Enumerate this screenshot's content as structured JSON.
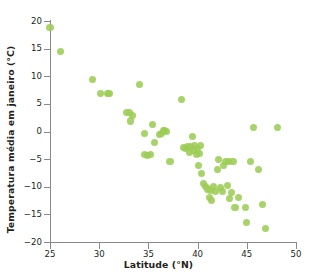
{
  "chart_data": {
    "type": "scatter",
    "title": "",
    "xlabel": "Latitude (°N)",
    "ylabel": "Temperatura média em janeiro (°C)",
    "xlim": [
      25,
      50
    ],
    "ylim": [
      -20,
      20
    ],
    "xticks": [
      25,
      30,
      35,
      40,
      45,
      50
    ],
    "yticks": [
      20,
      15,
      10,
      5,
      0,
      -5,
      -10,
      -15,
      -20
    ],
    "xtick_labels": [
      "25",
      "30",
      "35",
      "40",
      "45",
      "50"
    ],
    "ytick_labels": [
      "20",
      "15",
      "10",
      "5",
      "0",
      "−5",
      "−10",
      "−15",
      "−20"
    ],
    "grid": false,
    "legend": null,
    "marker_color": "#9ccc55",
    "axis_color": "#8a8a8a",
    "text_color": "#231f20",
    "series": [
      {
        "name": "Cidades",
        "points": [
          [
            25.0,
            18.9
          ],
          [
            26.1,
            14.5
          ],
          [
            29.3,
            9.4
          ],
          [
            30.1,
            6.9
          ],
          [
            30.8,
            6.9
          ],
          [
            31.0,
            6.8
          ],
          [
            32.8,
            3.4
          ],
          [
            33.1,
            3.4
          ],
          [
            33.4,
            2.9
          ],
          [
            33.2,
            1.9
          ],
          [
            34.1,
            8.5
          ],
          [
            34.6,
            -0.4
          ],
          [
            34.6,
            -4.2
          ],
          [
            34.9,
            -4.3
          ],
          [
            35.2,
            -4.2
          ],
          [
            35.4,
            1.2
          ],
          [
            35.6,
            -2.0
          ],
          [
            36.1,
            -0.5
          ],
          [
            36.3,
            -0.4
          ],
          [
            36.5,
            0.1
          ],
          [
            36.6,
            0.1
          ],
          [
            36.8,
            0.0
          ],
          [
            37.2,
            -5.4
          ],
          [
            38.4,
            5.8
          ],
          [
            38.6,
            -2.9
          ],
          [
            38.8,
            -3.0
          ],
          [
            39.0,
            -2.7
          ],
          [
            39.2,
            -3.8
          ],
          [
            39.3,
            -2.8
          ],
          [
            39.5,
            -0.9
          ],
          [
            39.6,
            -3.4
          ],
          [
            39.7,
            -2.6
          ],
          [
            39.9,
            -4.1
          ],
          [
            40.0,
            -3.0
          ],
          [
            40.1,
            -6.2
          ],
          [
            40.2,
            -4.0
          ],
          [
            40.3,
            -2.5
          ],
          [
            40.4,
            -7.6
          ],
          [
            40.6,
            -9.4
          ],
          [
            40.8,
            -10.0
          ],
          [
            41.0,
            -10.4
          ],
          [
            41.2,
            -11.9
          ],
          [
            41.3,
            -10.6
          ],
          [
            41.4,
            -12.5
          ],
          [
            41.6,
            -9.9
          ],
          [
            41.8,
            -10.8
          ],
          [
            42.0,
            -6.9
          ],
          [
            42.1,
            -5.0
          ],
          [
            42.3,
            -10.2
          ],
          [
            42.5,
            -10.8
          ],
          [
            42.6,
            -6.2
          ],
          [
            42.8,
            -5.4
          ],
          [
            43.0,
            -9.8
          ],
          [
            43.1,
            -5.4
          ],
          [
            43.2,
            -12.1
          ],
          [
            43.4,
            -11.0
          ],
          [
            43.6,
            -5.5
          ],
          [
            43.8,
            -13.7
          ],
          [
            44.2,
            -12.0
          ],
          [
            44.9,
            -13.7
          ],
          [
            45.0,
            -16.5
          ],
          [
            45.4,
            -5.4
          ],
          [
            45.7,
            0.8
          ],
          [
            46.2,
            -6.9
          ],
          [
            46.6,
            -13.2
          ],
          [
            46.9,
            -17.5
          ],
          [
            48.1,
            0.7
          ]
        ]
      }
    ]
  }
}
